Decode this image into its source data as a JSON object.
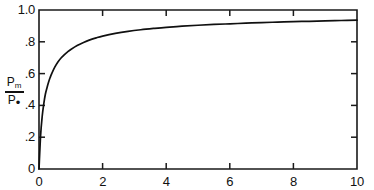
{
  "chart_data": {
    "type": "line",
    "title": "",
    "subtitle": "",
    "xlabel": "",
    "ylabel": "Pm/P.",
    "ylabel_parts": {
      "numerator_base": "P",
      "numerator_sub": "m",
      "denominator_base": "P",
      "denominator_sub": "•"
    },
    "xlim": [
      0,
      10
    ],
    "ylim": [
      0,
      1.0
    ],
    "grid": false,
    "legend": null,
    "xticks": [
      0,
      2,
      4,
      6,
      8,
      10
    ],
    "xtick_labels": [
      "0",
      "2",
      "4",
      "6",
      "8",
      "10"
    ],
    "yticks": [
      0,
      0.2,
      0.4,
      0.6,
      0.8,
      1.0
    ],
    "ytick_labels": [
      "0",
      ".2",
      ".4",
      ".6",
      ".8",
      "1.0"
    ],
    "tick_direction": "in",
    "box_frame": true,
    "line_color": "#101010",
    "axis_color": "#1a1a1a",
    "background_color": "#ffffff",
    "series": [
      {
        "name": "Pm/P.",
        "x": [
          0,
          0.05,
          0.1,
          0.15,
          0.2,
          0.25,
          0.3,
          0.35,
          0.4,
          0.5,
          0.6,
          0.7,
          0.8,
          0.9,
          1.0,
          1.2,
          1.4,
          1.6,
          1.8,
          2.0,
          2.4,
          2.8,
          3.2,
          3.6,
          4.0,
          4.5,
          5.0,
          5.5,
          6.0,
          6.5,
          7.0,
          7.5,
          8.0,
          8.5,
          9.0,
          9.5,
          10.0
        ],
        "y": [
          0.0,
          0.21,
          0.33,
          0.41,
          0.47,
          0.51,
          0.545,
          0.575,
          0.6,
          0.642,
          0.675,
          0.7,
          0.72,
          0.737,
          0.752,
          0.777,
          0.796,
          0.812,
          0.825,
          0.836,
          0.853,
          0.866,
          0.876,
          0.884,
          0.891,
          0.898,
          0.904,
          0.909,
          0.913,
          0.917,
          0.921,
          0.924,
          0.927,
          0.929,
          0.932,
          0.934,
          0.936
        ]
      }
    ]
  },
  "layout": {
    "plot_left_px": 39,
    "plot_right_px": 357,
    "plot_top_px": 10,
    "plot_bottom_px": 169
  }
}
